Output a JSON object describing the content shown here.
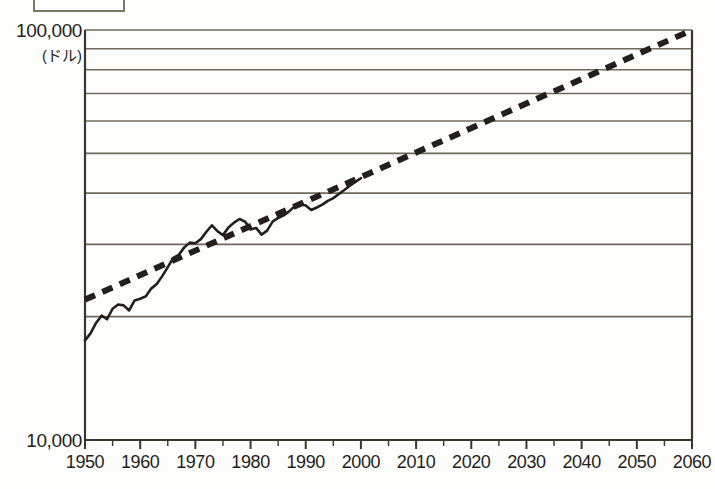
{
  "page": {
    "background_color": "#fdfdfb",
    "ink_color": "#241f1c",
    "rule_color": "#6f6a5c"
  },
  "cropped_caption_box": {
    "label": "",
    "note": "partially cropped rectangular box at top edge"
  },
  "chart_data": {
    "type": "line",
    "title": "",
    "xlabel": "",
    "ylabel": "",
    "y_unit_label": "(ドル)",
    "yscale": "log",
    "ylim": [
      10000,
      100000
    ],
    "xlim": [
      1950,
      2060
    ],
    "y_axis_top_label": "100,000",
    "y_axis_bottom_label": "10,000",
    "grid": true,
    "gridlines_y": [
      20000,
      30000,
      40000,
      50000,
      60000,
      70000,
      80000,
      90000,
      100000
    ],
    "x_major_ticks": [
      1950,
      1960,
      1970,
      1980,
      1990,
      2000,
      2010,
      2020,
      2030,
      2040,
      2050,
      2060
    ],
    "x_minor_tick_interval": 5,
    "legend": [],
    "series": [
      {
        "name": "actual",
        "style": "solid",
        "color": "#241f1c",
        "x": [
          1950,
          1951,
          1952,
          1953,
          1954,
          1955,
          1956,
          1957,
          1958,
          1959,
          1960,
          1961,
          1962,
          1963,
          1964,
          1965,
          1966,
          1967,
          1968,
          1969,
          1970,
          1971,
          1972,
          1973,
          1974,
          1975,
          1976,
          1977,
          1978,
          1979,
          1980,
          1981,
          1982,
          1983,
          1984,
          1985,
          1986,
          1987,
          1988,
          1989,
          1990,
          1991,
          1992,
          1993,
          1994,
          1995,
          1996,
          1997,
          1998,
          1999,
          2000
        ],
        "values": [
          17500,
          18200,
          19300,
          20100,
          19700,
          20900,
          21400,
          21300,
          20700,
          21900,
          22100,
          22400,
          23400,
          24000,
          25100,
          26400,
          27800,
          28300,
          29500,
          30300,
          30200,
          30900,
          32200,
          33400,
          32300,
          31600,
          33000,
          33900,
          34600,
          34100,
          32600,
          32900,
          31700,
          32400,
          34100,
          34800,
          35300,
          36100,
          37200,
          37600,
          37300,
          36400,
          36900,
          37500,
          38300,
          38900,
          39800,
          40700,
          41700,
          42600,
          43500
        ],
        "start_value": 17500,
        "end_value": 43500
      },
      {
        "name": "trend",
        "style": "dashed",
        "color": "#241f1c",
        "x": [
          1950,
          2060
        ],
        "values": [
          22000,
          100000
        ],
        "start_value": 22000,
        "end_value": 100000
      }
    ]
  }
}
